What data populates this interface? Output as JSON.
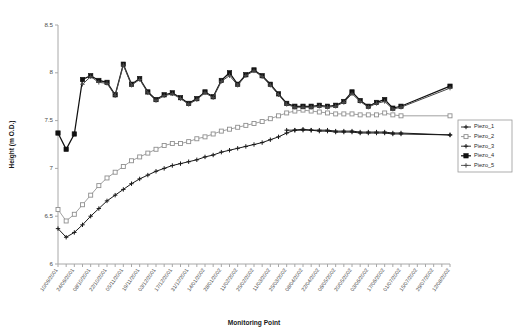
{
  "chart_data": {
    "type": "line",
    "title": "",
    "xlabel": "Monitoring Point",
    "ylabel": "Height (m O.D.)",
    "ylim": [
      6,
      8.5
    ],
    "yticks": [
      "6",
      "6.5",
      "7",
      "7.5",
      "8",
      "8.5"
    ],
    "grid": false,
    "legend_position": "right",
    "categories": [
      "10/09/2001",
      "17/09/2001",
      "24/09/2001",
      "01/10/2001",
      "08/10/2001",
      "15/10/2001",
      "22/10/2001",
      "29/10/2001",
      "05/11/2001",
      "12/11/2001",
      "19/11/2001",
      "26/11/2001",
      "03/12/2001",
      "10/12/2001",
      "17/12/2001",
      "24/12/2001",
      "31/12/2001",
      "07/01/2002",
      "14/01/2002",
      "21/01/2002",
      "28/01/2002",
      "04/02/2002",
      "11/02/2002",
      "18/02/2002",
      "25/02/2002",
      "04/03/2002",
      "11/03/2002",
      "18/03/2002",
      "25/03/2002",
      "01/04/2002",
      "08/04/2002",
      "15/04/2002",
      "22/04/2002",
      "29/04/2002",
      "06/05/2002",
      "13/05/2002",
      "20/05/2002",
      "27/05/2002",
      "03/06/2002",
      "10/06/2002",
      "17/06/2002",
      "24/06/2002",
      "01/07/2002",
      "08/07/2002",
      "15/07/2002",
      "22/07/2002",
      "29/07/2002",
      "05/08/2002",
      "12/08/2002"
    ],
    "xtick_labels": [
      "10/09/2001",
      "24/09/2001",
      "08/10/2001",
      "22/10/2001",
      "05/11/2001",
      "19/11/2001",
      "03/12/2001",
      "17/12/2001",
      "31/12/2001",
      "14/01/2002",
      "28/01/2002",
      "11/02/2002",
      "25/02/2002",
      "11/03/2002",
      "25/03/2002",
      "08/04/2002",
      "22/04/2002",
      "06/05/2002",
      "20/05/2002",
      "03/06/2002",
      "17/06/2002",
      "01/07/2002",
      "15/07/2002",
      "29/07/2002",
      "12/08/2002"
    ],
    "series": [
      {
        "name": "Piezo_1",
        "marker": "plus",
        "color": "#1a1a1a",
        "values": [
          null,
          null,
          null,
          null,
          null,
          null,
          null,
          null,
          null,
          null,
          null,
          null,
          null,
          null,
          null,
          null,
          null,
          null,
          null,
          null,
          null,
          null,
          null,
          null,
          null,
          null,
          null,
          null,
          7.4,
          7.4,
          7.4,
          7.4,
          7.39,
          7.39,
          7.38,
          7.38,
          7.38,
          7.37,
          7.37,
          7.37,
          7.37,
          7.36,
          7.36,
          null,
          null,
          null,
          null,
          null,
          7.35
        ]
      },
      {
        "name": "Piezo_2",
        "marker": "square-open",
        "color": "#8f8f8f",
        "values": [
          6.57,
          6.45,
          6.52,
          6.62,
          6.72,
          6.82,
          6.9,
          6.96,
          7.02,
          7.08,
          7.12,
          7.16,
          7.2,
          7.24,
          7.26,
          7.26,
          7.28,
          7.31,
          7.33,
          7.36,
          7.39,
          7.41,
          7.43,
          7.45,
          7.47,
          7.49,
          7.52,
          7.55,
          7.58,
          7.6,
          7.61,
          7.6,
          7.59,
          7.58,
          7.57,
          7.57,
          7.57,
          7.56,
          7.56,
          7.56,
          7.58,
          7.56,
          7.55,
          null,
          null,
          null,
          null,
          null,
          7.55
        ]
      },
      {
        "name": "Piezo_3",
        "marker": "plus",
        "color": "#1a1a1a",
        "values": [
          6.37,
          6.28,
          6.33,
          6.41,
          6.5,
          6.58,
          6.66,
          6.72,
          6.78,
          6.84,
          6.89,
          6.93,
          6.97,
          7.0,
          7.03,
          7.05,
          7.07,
          7.09,
          7.12,
          7.14,
          7.17,
          7.19,
          7.21,
          7.23,
          7.25,
          7.27,
          7.3,
          7.33,
          7.37,
          7.4,
          7.41,
          7.4,
          7.4,
          7.4,
          7.39,
          7.39,
          7.39,
          7.38,
          7.38,
          7.38,
          7.38,
          7.37,
          7.37,
          null,
          null,
          null,
          null,
          null,
          7.35
        ]
      },
      {
        "name": "Piezo_4",
        "marker": "square-filled",
        "color": "#111111",
        "values": [
          7.37,
          7.2,
          7.36,
          7.93,
          7.97,
          7.92,
          7.9,
          7.77,
          8.09,
          7.88,
          7.94,
          7.8,
          7.72,
          7.77,
          7.79,
          7.74,
          7.68,
          7.73,
          7.8,
          7.75,
          7.92,
          8.0,
          7.88,
          7.98,
          8.03,
          7.97,
          7.88,
          7.78,
          7.68,
          7.65,
          7.65,
          7.65,
          7.66,
          7.65,
          7.66,
          7.7,
          7.8,
          7.71,
          7.65,
          7.69,
          7.72,
          7.63,
          7.65,
          null,
          null,
          null,
          null,
          null,
          7.86
        ]
      },
      {
        "name": "Piezo_5",
        "marker": "plus",
        "color": "#4a4a4a",
        "values": [
          null,
          null,
          null,
          7.88,
          7.96,
          7.9,
          7.89,
          7.76,
          8.08,
          7.87,
          7.93,
          7.79,
          7.71,
          7.76,
          7.78,
          7.73,
          7.67,
          7.72,
          7.79,
          7.74,
          7.91,
          7.97,
          7.87,
          7.97,
          8.02,
          7.96,
          7.87,
          7.77,
          7.67,
          7.64,
          7.64,
          7.64,
          7.65,
          7.64,
          7.65,
          7.69,
          7.78,
          7.7,
          7.64,
          7.68,
          7.7,
          7.62,
          7.64,
          null,
          null,
          null,
          null,
          null,
          7.84
        ]
      }
    ]
  },
  "legend": {
    "items": [
      {
        "label": "Piezo_1"
      },
      {
        "label": "Piezo_2"
      },
      {
        "label": "Piezo_3"
      },
      {
        "label": "Piezo_4"
      },
      {
        "label": "Piezo_5"
      }
    ]
  }
}
